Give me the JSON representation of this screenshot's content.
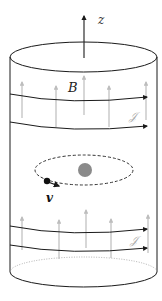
{
  "figure": {
    "type": "solenoid-schematic",
    "axis_label": "z",
    "field_label": "B",
    "current_label_top": "𝒥",
    "current_label_bottom": "𝒥",
    "velocity_label": "v",
    "colors": {
      "outline": "#1a1a1a",
      "field_arrows": "#bdbdbd",
      "current_label": "#a8a8a8",
      "center_charge": "#8a8a8a",
      "particle": "#111111",
      "orbit": "#333333",
      "bottom_dotted": "#9a9a9a"
    }
  }
}
